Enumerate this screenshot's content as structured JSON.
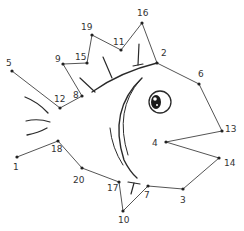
{
  "puzzle": {
    "type": "connect-the-dots",
    "subject": "fish",
    "line_color": "#555555",
    "dot_color": "#222222",
    "drawing_color": "#2a2a2a",
    "dots": [
      {
        "label": "5",
        "x": 12,
        "y": 71,
        "lx": 6,
        "ly": 66
      },
      {
        "label": "12",
        "x": 60,
        "y": 108,
        "lx": 54,
        "ly": 102
      },
      {
        "label": "8",
        "x": 82,
        "y": 96,
        "lx": 73,
        "ly": 98
      },
      {
        "label": "9",
        "x": 63,
        "y": 64,
        "lx": 55,
        "ly": 62
      },
      {
        "label": "15",
        "x": 87,
        "y": 63,
        "lx": 75,
        "ly": 60
      },
      {
        "label": "19",
        "x": 92,
        "y": 35,
        "lx": 81,
        "ly": 30
      },
      {
        "label": "11",
        "x": 121,
        "y": 50,
        "lx": 113,
        "ly": 45
      },
      {
        "label": "16",
        "x": 142,
        "y": 23,
        "lx": 137,
        "ly": 16
      },
      {
        "label": "2",
        "x": 157,
        "y": 63,
        "lx": 161,
        "ly": 56
      },
      {
        "label": "6",
        "x": 199,
        "y": 84,
        "lx": 198,
        "ly": 77
      },
      {
        "label": "13",
        "x": 222,
        "y": 131,
        "lx": 225,
        "ly": 132
      },
      {
        "label": "4",
        "x": 166,
        "y": 142,
        "lx": 152,
        "ly": 146
      },
      {
        "label": "14",
        "x": 219,
        "y": 158,
        "lx": 224,
        "ly": 166
      },
      {
        "label": "3",
        "x": 183,
        "y": 189,
        "lx": 180,
        "ly": 203
      },
      {
        "label": "7",
        "x": 148,
        "y": 186,
        "lx": 144,
        "ly": 198
      },
      {
        "label": "10",
        "x": 123,
        "y": 211,
        "lx": 118,
        "ly": 223
      },
      {
        "label": "17",
        "x": 119,
        "y": 182,
        "lx": 107,
        "ly": 191
      },
      {
        "label": "20",
        "x": 82,
        "y": 168,
        "lx": 73,
        "ly": 183
      },
      {
        "label": "18",
        "x": 58,
        "y": 141,
        "lx": 51,
        "ly": 152
      },
      {
        "label": "1",
        "x": 17,
        "y": 157,
        "lx": 13,
        "ly": 170
      }
    ],
    "path_order": [
      "5",
      "12",
      "8",
      "9",
      "15",
      "19",
      "11",
      "16",
      "2",
      "6",
      "13",
      "4",
      "14",
      "3",
      "7",
      "10",
      "17",
      "20",
      "18",
      "1"
    ]
  }
}
